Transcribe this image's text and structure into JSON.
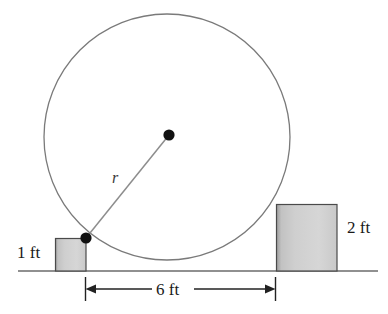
{
  "figure": {
    "colors": {
      "ground": "#6b6b6b",
      "circle_stroke": "#7a7a7a",
      "radius_stroke": "#8a8a8a",
      "dot": "#111111",
      "block_border": "#4a4a4a",
      "block_fill_light": "#e6e6e6",
      "block_fill_dark": "#b0b0b0",
      "dimension_line": "#222222",
      "text": "#1a1a1a"
    },
    "labels": {
      "left_block_height": "1 ft",
      "right_block_height": "2 ft",
      "span": "6 ft",
      "radius": "r"
    },
    "geometry": {
      "circle": {
        "cx": 167,
        "cy": 137,
        "r": 123
      },
      "center_dot": {
        "x": 169,
        "y": 135,
        "r": 5.5
      },
      "tangent_dot": {
        "x": 86,
        "y": 238,
        "r": 5.5
      },
      "radius_line": {
        "x1": 86,
        "y1": 238,
        "x2": 169,
        "y2": 135
      },
      "ground_line": {
        "x1": 18,
        "y1": 271,
        "x2": 378,
        "y2": 271
      },
      "left_block": {
        "x": 55,
        "y": 238,
        "width": 31,
        "height": 33
      },
      "right_block": {
        "x": 276,
        "y": 204,
        "width": 61,
        "height": 67
      },
      "dimension": {
        "y": 289,
        "x1": 85,
        "x2": 275,
        "tick_top": 277,
        "tick_bottom": 301
      }
    }
  }
}
